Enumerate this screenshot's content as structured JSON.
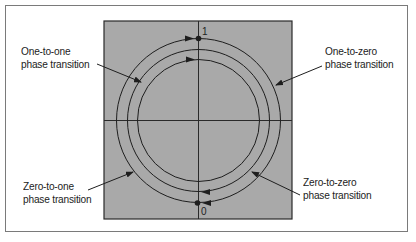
{
  "diagram": {
    "type": "phase-transition-circle",
    "colors": {
      "plot_background": "#a9a9a9",
      "line": "#1e1e1e",
      "frame": "#7a7a7a",
      "page_background": "#ffffff"
    },
    "points": [
      {
        "id": "one",
        "label": "1",
        "position": "top"
      },
      {
        "id": "zero",
        "label": "0",
        "position": "bottom"
      }
    ],
    "labels": [
      {
        "id": "one-to-one",
        "line1": "One-to-one",
        "line2": "phase transition"
      },
      {
        "id": "one-to-zero",
        "line1": "One-to-zero",
        "line2": "phase transition"
      },
      {
        "id": "zero-to-one",
        "line1": "Zero-to-one",
        "line2": "phase transition"
      },
      {
        "id": "zero-to-zero",
        "line1": "Zero-to-zero",
        "line2": "phase transition"
      }
    ]
  }
}
